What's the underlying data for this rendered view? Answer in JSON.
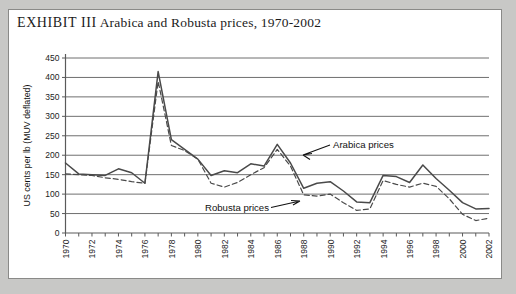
{
  "title": {
    "label_prefix": "EXHIBIT III",
    "label_main": "Arabica and Robusta prices, 1970-2002"
  },
  "colors": {
    "page_background": "#c8c8c6",
    "panel_background": "#ffffff",
    "panel_border": "#8a8a88",
    "gridline": "#6f6f6f",
    "line": "#4a4a4a",
    "text": "#1b1b1b"
  },
  "annotations": {
    "arabica": "Arabica prices",
    "robusta": "Robusta prices"
  },
  "chart_data": {
    "type": "line",
    "title": "EXHIBIT III  Arabica and Robusta prices, 1970-2002",
    "xlabel": "",
    "ylabel": "US cents per lb (MUV deflated)",
    "ylim": [
      0,
      450
    ],
    "yticks": [
      0,
      50,
      100,
      150,
      200,
      250,
      300,
      350,
      400,
      450
    ],
    "xlim": [
      1970,
      2002
    ],
    "xticks": [
      1970,
      1971,
      1972,
      1973,
      1974,
      1975,
      1976,
      1977,
      1978,
      1979,
      1980,
      1981,
      1982,
      1983,
      1984,
      1985,
      1986,
      1987,
      1988,
      1989,
      1990,
      1991,
      1992,
      1993,
      1994,
      1995,
      1996,
      1997,
      1998,
      1999,
      2000,
      2001,
      2002
    ],
    "xtick_labels": [
      1970,
      1972,
      1974,
      1976,
      1978,
      1980,
      1982,
      1984,
      1986,
      1988,
      1990,
      1992,
      1994,
      1996,
      1998,
      2000,
      2002
    ],
    "grid": true,
    "legend": "annotated-inline",
    "x": [
      1970,
      1971,
      1972,
      1973,
      1974,
      1975,
      1976,
      1977,
      1978,
      1979,
      1980,
      1981,
      1982,
      1983,
      1984,
      1985,
      1986,
      1987,
      1988,
      1989,
      1990,
      1991,
      1992,
      1993,
      1994,
      1995,
      1996,
      1997,
      1998,
      1999,
      2000,
      2001,
      2002
    ],
    "series": [
      {
        "name": "Arabica prices",
        "style": "solid",
        "values": [
          180,
          152,
          150,
          148,
          165,
          155,
          128,
          415,
          240,
          215,
          190,
          148,
          160,
          155,
          178,
          172,
          228,
          180,
          115,
          128,
          132,
          108,
          80,
          78,
          148,
          145,
          130,
          175,
          140,
          110,
          78,
          62,
          63
        ]
      },
      {
        "name": "Robusta prices",
        "style": "dashed",
        "values": [
          152,
          150,
          148,
          142,
          138,
          132,
          128,
          390,
          225,
          212,
          190,
          128,
          118,
          130,
          150,
          168,
          215,
          172,
          98,
          95,
          100,
          78,
          58,
          62,
          135,
          125,
          118,
          128,
          120,
          88,
          48,
          32,
          38
        ]
      }
    ]
  }
}
